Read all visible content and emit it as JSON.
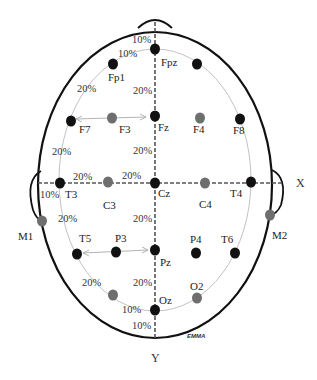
{
  "axes": {
    "x_label": "X",
    "y_label": "Y"
  },
  "colors": {
    "outline": "#111111",
    "guide": "#bbbbbb",
    "axis_line": "#666666",
    "electrode_primary": "#111111",
    "electrode_secondary": "#6e6e6e",
    "text": "#222222"
  },
  "electrodes": [
    {
      "id": "Fpz",
      "label": "Fpz",
      "x": 155,
      "y": 49,
      "type": "primary",
      "lx": 161,
      "ly": 66
    },
    {
      "id": "Fp1",
      "label": "Fp1",
      "x": 113,
      "y": 64,
      "type": "primary",
      "lx": 108,
      "ly": 81
    },
    {
      "id": "Fp2",
      "label": "",
      "x": 197,
      "y": 64,
      "type": "primary",
      "lx": 0,
      "ly": 0
    },
    {
      "id": "F7",
      "label": "F7",
      "x": 71,
      "y": 121,
      "type": "primary",
      "lx": 79,
      "ly": 133
    },
    {
      "id": "F3",
      "label": "F3",
      "x": 112,
      "y": 118,
      "type": "secondary",
      "lx": 119,
      "ly": 133
    },
    {
      "id": "Fz",
      "label": "Fz",
      "x": 155,
      "y": 116,
      "type": "primary",
      "lx": 158,
      "ly": 131
    },
    {
      "id": "F4",
      "label": "F4",
      "x": 200,
      "y": 118,
      "type": "secondary",
      "lx": 193,
      "ly": 133
    },
    {
      "id": "F8",
      "label": "F8",
      "x": 240,
      "y": 119,
      "type": "primary",
      "lx": 233,
      "ly": 134
    },
    {
      "id": "T3",
      "label": "T3",
      "x": 60,
      "y": 183,
      "type": "primary",
      "lx": 65,
      "ly": 198
    },
    {
      "id": "C3",
      "label": "C3",
      "x": 108,
      "y": 182,
      "type": "secondary",
      "lx": 103,
      "ly": 209
    },
    {
      "id": "Cz",
      "label": "Cz",
      "x": 155,
      "y": 183,
      "type": "primary",
      "lx": 158,
      "ly": 197
    },
    {
      "id": "C4",
      "label": "C4",
      "x": 205,
      "y": 183,
      "type": "secondary",
      "lx": 199,
      "ly": 208
    },
    {
      "id": "T4",
      "label": "T4",
      "x": 251,
      "y": 182,
      "type": "primary",
      "lx": 230,
      "ly": 197
    },
    {
      "id": "M1",
      "label": "M1",
      "x": 42,
      "y": 221,
      "type": "secondary",
      "lx": 18,
      "ly": 240
    },
    {
      "id": "M2",
      "label": "M2",
      "x": 270,
      "y": 215,
      "type": "secondary",
      "lx": 272,
      "ly": 239
    },
    {
      "id": "T5",
      "label": "T5",
      "x": 77,
      "y": 254,
      "type": "primary",
      "lx": 79,
      "ly": 242
    },
    {
      "id": "P3",
      "label": "P3",
      "x": 116,
      "y": 252,
      "type": "primary",
      "lx": 115,
      "ly": 242
    },
    {
      "id": "Pz",
      "label": "Pz",
      "x": 155,
      "y": 250,
      "type": "primary",
      "lx": 160,
      "ly": 266
    },
    {
      "id": "P4",
      "label": "P4",
      "x": 196,
      "y": 253,
      "type": "primary",
      "lx": 190,
      "ly": 243
    },
    {
      "id": "T6",
      "label": "T6",
      "x": 235,
      "y": 253,
      "type": "primary",
      "lx": 221,
      "ly": 243
    },
    {
      "id": "O1",
      "label": "",
      "x": 113,
      "y": 295,
      "type": "secondary",
      "lx": 0,
      "ly": 0
    },
    {
      "id": "Oz",
      "label": "Oz",
      "x": 155,
      "y": 310,
      "type": "primary",
      "lx": 159,
      "ly": 304
    },
    {
      "id": "O2",
      "label": "O2",
      "x": 197,
      "y": 298,
      "type": "secondary",
      "lx": 190,
      "ly": 290
    }
  ],
  "percent_labels": [
    {
      "text": "10%",
      "x": 132,
      "y": 43
    },
    {
      "text": "10%",
      "x": 118,
      "y": 57
    },
    {
      "text": "20%",
      "x": 77,
      "y": 92
    },
    {
      "text": "20%",
      "x": 133,
      "y": 94
    },
    {
      "text": "20%",
      "x": 52,
      "y": 155
    },
    {
      "text": "20%",
      "x": 133,
      "y": 154
    },
    {
      "text": "20%",
      "x": 73,
      "y": 180
    },
    {
      "text": "20%",
      "x": 122,
      "y": 179
    },
    {
      "text": "10%",
      "x": 40,
      "y": 198
    },
    {
      "text": "20%",
      "x": 58,
      "y": 222
    },
    {
      "text": "20%",
      "x": 133,
      "y": 222
    },
    {
      "text": "20%",
      "x": 82,
      "y": 286
    },
    {
      "text": "20%",
      "x": 133,
      "y": 286
    },
    {
      "text": "10%",
      "x": 122,
      "y": 313
    },
    {
      "text": "10%",
      "x": 132,
      "y": 329
    }
  ],
  "signature": "EMMA"
}
